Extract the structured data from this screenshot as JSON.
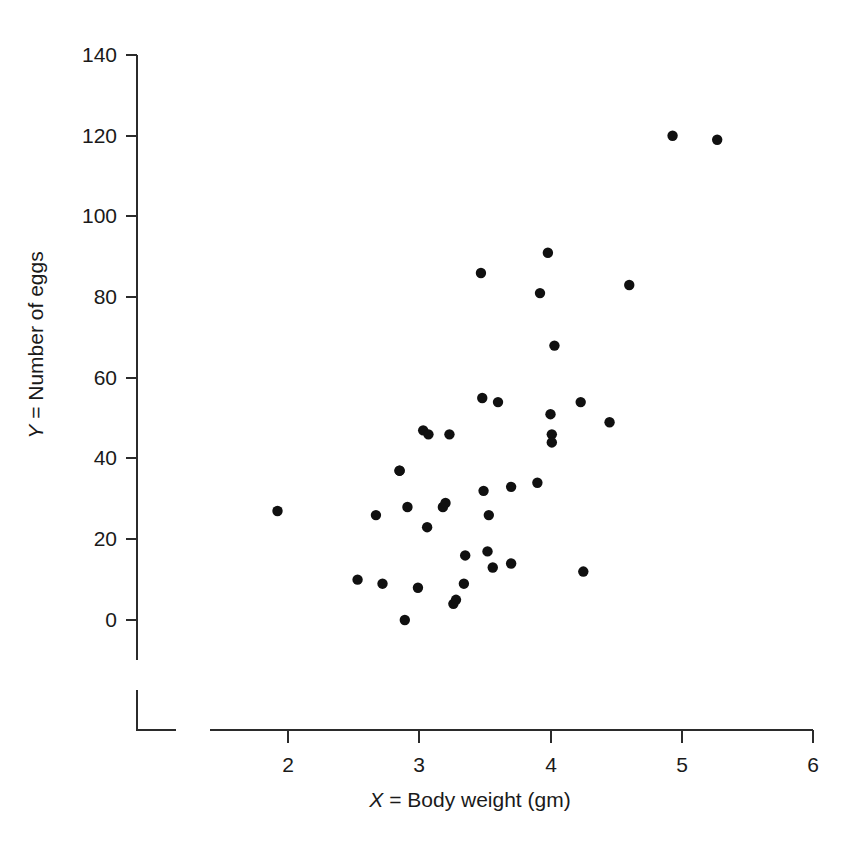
{
  "figure": {
    "background_color": "#ffffff",
    "point_color": "#101010",
    "axis_color": "#2b2b2b"
  },
  "chart_data": {
    "type": "scatter",
    "title": "",
    "xlabel": "X = Body weight (gm)",
    "xlabel_italic_prefix": "X",
    "xlabel_rest": " = Body weight (gm)",
    "ylabel": "Y = Number of eggs",
    "ylabel_italic_prefix": "Y",
    "ylabel_rest": " = Number of eggs",
    "xlim": [
      1.4,
      6.0
    ],
    "ylim": [
      -10,
      140
    ],
    "xticks": [
      2,
      3,
      4,
      5,
      6
    ],
    "xtick_labels": [
      "2",
      "3",
      "4",
      "5",
      "6"
    ],
    "yticks": [
      0,
      20,
      40,
      60,
      80,
      100,
      120,
      140
    ],
    "ytick_labels": [
      "0",
      "20",
      "40",
      "60",
      "80",
      "100",
      "120",
      "140"
    ],
    "grid": false,
    "legend": null,
    "marker": "filled-circle",
    "n_points": 41,
    "points": [
      {
        "x": 1.92,
        "y": 27
      },
      {
        "x": 2.53,
        "y": 10
      },
      {
        "x": 2.67,
        "y": 26
      },
      {
        "x": 2.72,
        "y": 9
      },
      {
        "x": 2.85,
        "y": 37
      },
      {
        "x": 2.85,
        "y": 37
      },
      {
        "x": 2.89,
        "y": 0
      },
      {
        "x": 2.91,
        "y": 28
      },
      {
        "x": 2.99,
        "y": 8
      },
      {
        "x": 3.03,
        "y": 47
      },
      {
        "x": 3.06,
        "y": 23
      },
      {
        "x": 3.07,
        "y": 46
      },
      {
        "x": 3.18,
        "y": 28
      },
      {
        "x": 3.2,
        "y": 29
      },
      {
        "x": 3.23,
        "y": 46
      },
      {
        "x": 3.26,
        "y": 4
      },
      {
        "x": 3.28,
        "y": 5
      },
      {
        "x": 3.34,
        "y": 9
      },
      {
        "x": 3.35,
        "y": 16
      },
      {
        "x": 3.47,
        "y": 86
      },
      {
        "x": 3.48,
        "y": 55
      },
      {
        "x": 3.49,
        "y": 32
      },
      {
        "x": 3.52,
        "y": 17
      },
      {
        "x": 3.53,
        "y": 26
      },
      {
        "x": 3.56,
        "y": 13
      },
      {
        "x": 3.6,
        "y": 54
      },
      {
        "x": 3.7,
        "y": 14
      },
      {
        "x": 3.7,
        "y": 33
      },
      {
        "x": 3.9,
        "y": 34
      },
      {
        "x": 3.92,
        "y": 81
      },
      {
        "x": 3.98,
        "y": 91
      },
      {
        "x": 4.0,
        "y": 51
      },
      {
        "x": 4.01,
        "y": 46
      },
      {
        "x": 4.01,
        "y": 44
      },
      {
        "x": 4.03,
        "y": 68
      },
      {
        "x": 4.23,
        "y": 54
      },
      {
        "x": 4.25,
        "y": 12
      },
      {
        "x": 4.45,
        "y": 49
      },
      {
        "x": 4.6,
        "y": 83
      },
      {
        "x": 4.93,
        "y": 120
      },
      {
        "x": 5.27,
        "y": 119
      }
    ]
  }
}
